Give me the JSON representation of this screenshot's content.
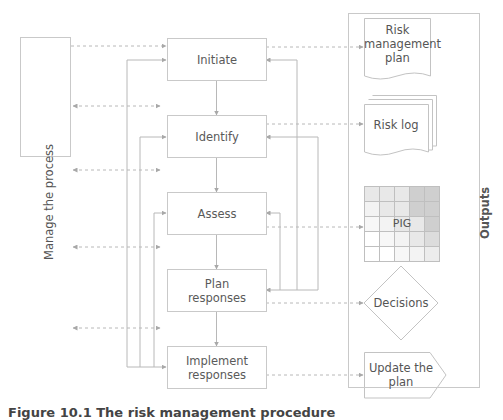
{
  "diagram": {
    "manage_box": {
      "label": "Manage the process"
    },
    "process_steps": [
      {
        "id": "initiate",
        "label": "Initiate"
      },
      {
        "id": "identify",
        "label": "Identify"
      },
      {
        "id": "assess",
        "label": "Assess"
      },
      {
        "id": "plan",
        "label_line1": "Plan",
        "label_line2": "responses"
      },
      {
        "id": "implement",
        "label_line1": "Implement",
        "label_line2": "responses"
      }
    ],
    "outputs": {
      "title": "Outputs",
      "items": [
        {
          "id": "risk-management-plan",
          "shape": "document",
          "line1": "Risk",
          "line2": "management",
          "line3": "plan"
        },
        {
          "id": "risk-log",
          "shape": "multi-document",
          "label": "Risk log"
        },
        {
          "id": "pig",
          "shape": "grid",
          "label": "PIG"
        },
        {
          "id": "decisions",
          "shape": "diamond",
          "label": "Decisions"
        },
        {
          "id": "update-plan",
          "shape": "pentagon",
          "line1": "Update the",
          "line2": "plan"
        }
      ]
    },
    "colors": {
      "line": "#b5b5b5",
      "border": "#c9c9c9",
      "text": "#555555",
      "grid_light": "#efefef",
      "grid_mid": "#dcdcdc",
      "grid_dark": "#c7c7c7"
    }
  },
  "caption": "Figure 10.1 The risk management procedure"
}
